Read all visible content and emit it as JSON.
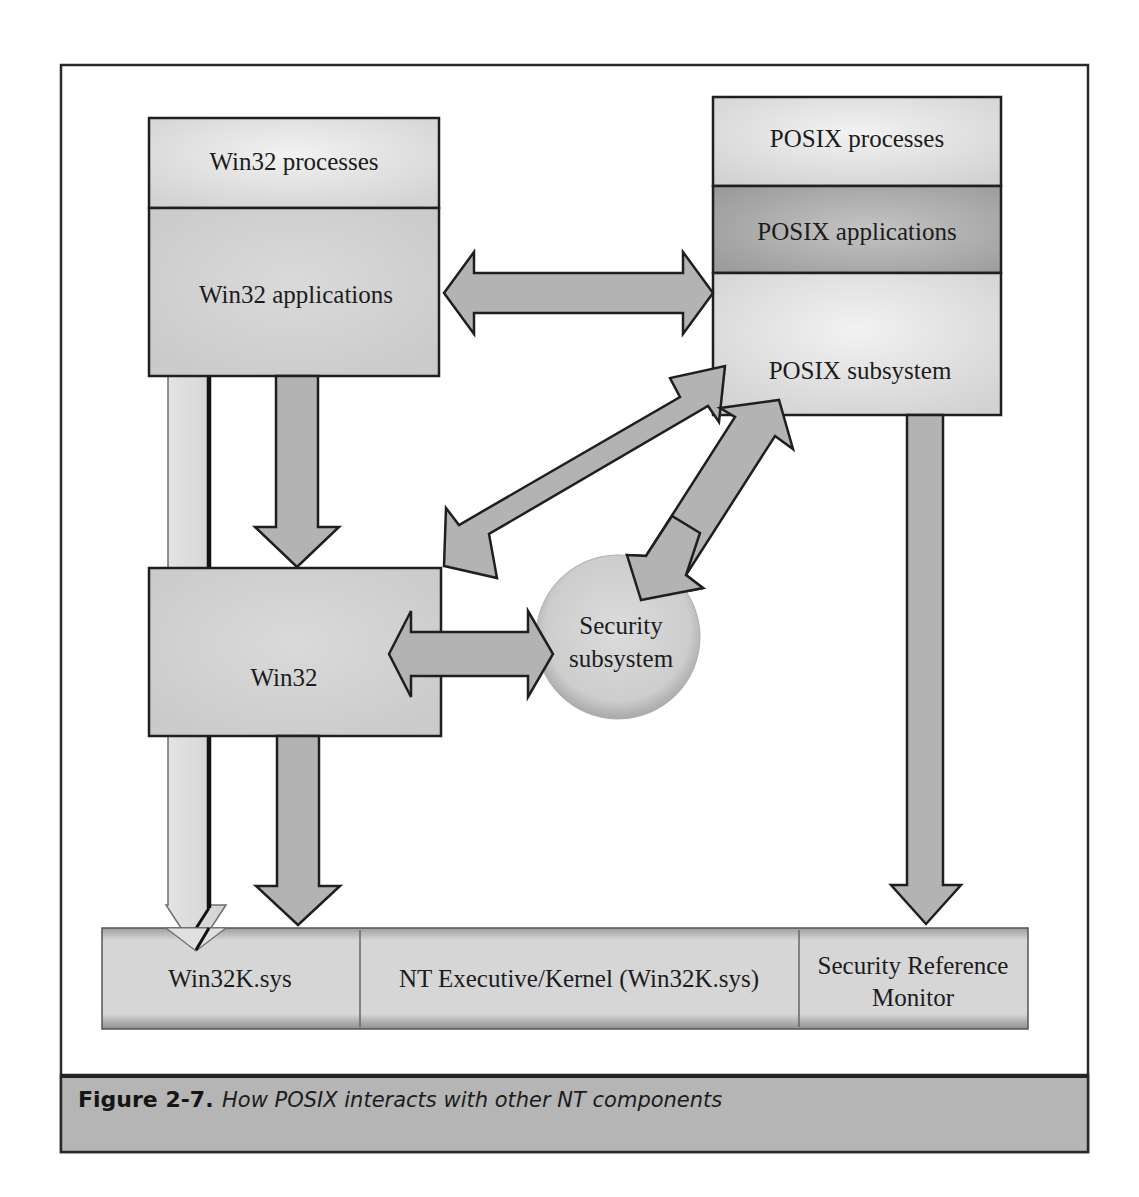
{
  "figure": {
    "number": "Figure 2-7.",
    "caption": "How POSIX interacts with other NT components"
  },
  "win32_stack": {
    "processes": "Win32 processes",
    "applications": "Win32 applications"
  },
  "posix_stack": {
    "processes": "POSIX processes",
    "applications": "POSIX applications",
    "subsystem": "POSIX subsystem"
  },
  "win32_subsystem": {
    "label": "Win32"
  },
  "security_subsystem": {
    "line1": "Security",
    "line2": "subsystem"
  },
  "kernel_bar": {
    "cells": [
      {
        "label": "Win32K.sys"
      },
      {
        "label": "NT Executive/Kernel (Win32K.sys)"
      },
      {
        "line1": "Security Reference",
        "line2": "Monitor"
      }
    ]
  },
  "connections": [
    {
      "from": "Win32 applications",
      "to": "POSIX subsystem",
      "type": "bidirectional"
    },
    {
      "from": "POSIX subsystem",
      "to": "Win32",
      "type": "bidirectional"
    },
    {
      "from": "POSIX subsystem",
      "to": "Security subsystem",
      "type": "bidirectional"
    },
    {
      "from": "Win32",
      "to": "Security subsystem",
      "type": "bidirectional"
    },
    {
      "from": "Win32 applications",
      "to": "Win32",
      "type": "down"
    },
    {
      "from": "Win32 applications",
      "to": "Win32K.sys",
      "type": "down"
    },
    {
      "from": "Win32",
      "to": "Win32K.sys",
      "type": "down"
    },
    {
      "from": "POSIX subsystem",
      "to": "Security Reference Monitor",
      "type": "down"
    }
  ],
  "colors": {
    "box_fill": "#d4d4d4",
    "box_light": "#e6e6e6",
    "posix_apps_fill": "#a9a9a9",
    "arrow_fill": "#b3b3b3",
    "caption_band": "#b5b5b5",
    "outline": "#1f1f1f"
  }
}
